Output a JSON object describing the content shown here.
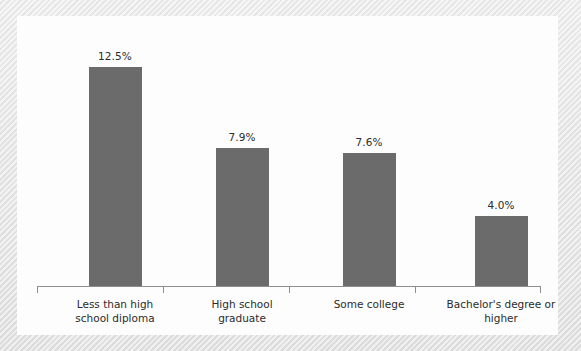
{
  "chart_data": {
    "type": "bar",
    "title": "",
    "subtitle": "",
    "xlabel": "",
    "ylabel": "",
    "grid": false,
    "legend": false,
    "legend_position": "none",
    "axis": {
      "x_axis_visible": true,
      "y_axis_visible": false,
      "tick_marks": "below-axis category boundaries",
      "tick_count": 5
    },
    "ylim": [
      0,
      14
    ],
    "units": "percent",
    "bar_color": "#6b6b6b",
    "background_color": "#fdfdfd",
    "page_background_color": "#e6e6e6",
    "categories": [
      "Less than high school diploma",
      "High school graduate",
      "Some college",
      "Bachelor's degree or higher"
    ],
    "category_lines": [
      [
        "Less than high",
        "school diploma"
      ],
      [
        "High school",
        "graduate"
      ],
      [
        "Some college",
        ""
      ],
      [
        "Bachelor's degree or",
        "higher"
      ]
    ],
    "values": [
      12.5,
      7.9,
      7.6,
      4.0
    ],
    "data_labels": [
      "12.5%",
      "7.9%",
      "7.6%",
      "4.0%"
    ]
  },
  "bars": [
    {
      "label": "12.5%",
      "value": 12.5,
      "left": 71,
      "width": 53,
      "height": 219,
      "label_left": 52,
      "label_top": 33
    },
    {
      "label": "7.9%",
      "value": 7.9,
      "left": 198,
      "width": 53,
      "height": 138,
      "label_left": 179,
      "label_top": 114
    },
    {
      "label": "7.6%",
      "value": 7.6,
      "left": 325,
      "width": 53,
      "height": 133,
      "label_left": 306,
      "label_top": 119
    },
    {
      "label": "4.0%",
      "value": 4.0,
      "left": 457,
      "width": 53,
      "height": 70,
      "label_left": 438,
      "label_top": 182
    }
  ],
  "ticks": [
    19,
    145,
    271,
    397,
    522
  ],
  "categories_layout": [
    {
      "left": 22,
      "line1": "Less than high",
      "line2": "school diploma"
    },
    {
      "left": 149,
      "line1": "High school",
      "line2": "graduate"
    },
    {
      "left": 276,
      "line1": "Some college",
      "line2": ""
    },
    {
      "left": 408,
      "line1": "Bachelor's degree or",
      "line2": "higher"
    }
  ]
}
